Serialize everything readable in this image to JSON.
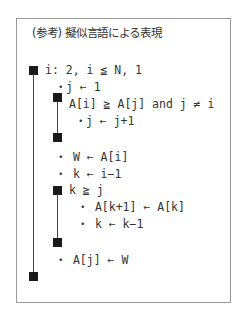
{
  "title": "(参考) 擬似言語による表現",
  "lines": [
    {
      "text": "i: 2, i ≦ N, 1"
    },
    {
      "text": "・j ← 1"
    },
    {
      "text": "A[i] ≧ A[j] and j ≠ i"
    },
    {
      "text": "・j ← j+1"
    },
    {
      "text": "・ W ← A[i]"
    },
    {
      "text": "・ k ← i−1"
    },
    {
      "text": "k ≧ j"
    },
    {
      "text": "・ A[k+1] ← A[k]"
    },
    {
      "text": "・ k ← k−1"
    },
    {
      "text": "・ A[j] ← W"
    }
  ],
  "colors": {
    "block": "#1a1a1a",
    "border": "#9a9a9a",
    "text": "#333333"
  }
}
